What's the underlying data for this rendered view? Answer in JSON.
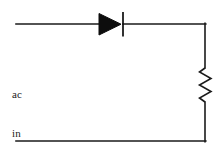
{
  "figure": {
    "type": "circuit-schematic",
    "background_color": "#ffffff",
    "line_color": "#1a1a1a",
    "fill_color": "#0d0d0d",
    "width": 222,
    "height": 153
  },
  "labels": {
    "source_line1": "ac",
    "source_line2": "in"
  },
  "components": [
    {
      "name": "diode",
      "symbol": "triangle-with-bar",
      "orientation": "anode-left-cathode-right",
      "apex_x": 121,
      "bar_x": 123
    },
    {
      "name": "resistor",
      "symbol": "zigzag",
      "orientation": "vertical",
      "peaks": 6,
      "top_y": 68,
      "bottom_y": 102
    }
  ],
  "geometry": {
    "top_wire": {
      "x1": 16,
      "y1": 24,
      "x2": 205,
      "y2": 24
    },
    "bottom_wire": {
      "x1": 16,
      "y1": 141,
      "x2": 205,
      "y2": 141
    },
    "right_wire_upper": {
      "x1": 205,
      "y1": 24,
      "x2": 205,
      "y2": 68
    },
    "right_wire_lower": {
      "x1": 205,
      "y1": 102,
      "x2": 205,
      "y2": 141
    }
  }
}
